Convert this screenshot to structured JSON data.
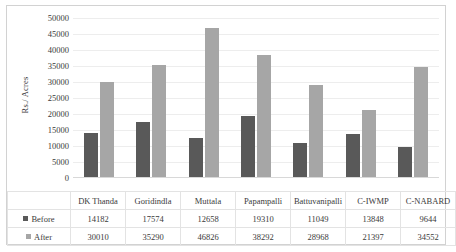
{
  "chart_data": {
    "type": "bar",
    "title": "",
    "xlabel": "",
    "ylabel": "Rs./ Acres",
    "ylim": [
      0,
      50000
    ],
    "ytick_step": 5000,
    "yticks": [
      "50000",
      "45000",
      "40000",
      "35000",
      "30000",
      "25000",
      "20000",
      "15000",
      "10000",
      "5000",
      "0"
    ],
    "grid": true,
    "legend_position": "table-left-column",
    "categories": [
      "DK Thanda",
      "Goridindla",
      "Muttala",
      "Papampalli",
      "Battuvanipalli",
      "C-IWMP",
      "C-NABARD"
    ],
    "series": [
      {
        "name": "Before",
        "color": "#595959",
        "values": [
          14182,
          17574,
          12658,
          19310,
          11049,
          13848,
          9644
        ],
        "labels": [
          "14182",
          "17574",
          "12658",
          "19310",
          "11049",
          "13848",
          "9644"
        ]
      },
      {
        "name": "After",
        "color": "#a6a6a6",
        "values": [
          30010,
          35290,
          46826,
          38292,
          28968,
          21397,
          34552
        ],
        "labels": [
          "30010",
          "35290",
          "46826",
          "38292",
          "28968",
          "21397",
          "34552"
        ]
      }
    ]
  },
  "icons": {
    "legend_marker_before": "square-marker-icon",
    "legend_marker_after": "square-marker-icon"
  }
}
